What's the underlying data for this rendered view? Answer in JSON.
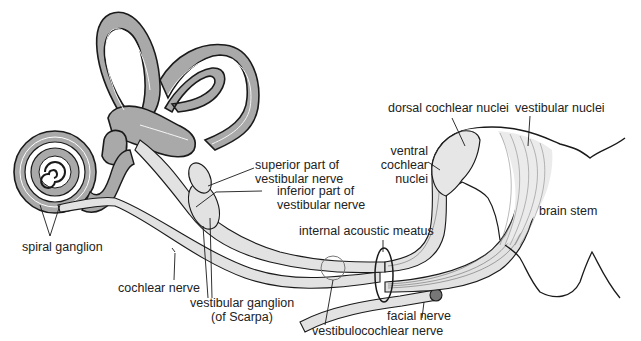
{
  "diagram": {
    "colors": {
      "labyrinth_fill": "#a9a9a9",
      "nerve_fill": "#e2e2e2",
      "nuclei_fill": "#e6e6e6",
      "outline": "#1a1a1a",
      "background": "#ffffff"
    },
    "labels": {
      "superior_vestibular_line1": "superior part of",
      "superior_vestibular_line2": "vestibular nerve",
      "inferior_vestibular_line1": "inferior part of",
      "inferior_vestibular_line2": "vestibular nerve",
      "dorsal_cochlear_nuclei": "dorsal cochlear nuclei",
      "vestibular_nuclei": "vestibular nuclei",
      "ventral_line1": "ventral",
      "ventral_line2": "cochlear",
      "ventral_line3": "nuclei",
      "brain_stem": "brain stem",
      "internal_acoustic_meatus": "internal acoustic meatus",
      "spiral_ganglion": "spiral ganglion",
      "cochlear_nerve": "cochlear nerve",
      "vestibular_ganglion_line1": "vestibular ganglion",
      "vestibular_ganglion_line2": "(of Scarpa)",
      "facial_nerve": "facial nerve",
      "vestibulocochlear_nerve": "vestibulocochlear nerve"
    }
  }
}
